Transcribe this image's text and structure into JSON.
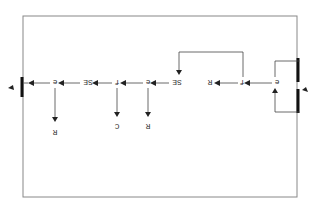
{
  "diagram": {
    "orientation": "rotated-180",
    "colors": {
      "frame": "#888888",
      "wire": "#444444",
      "bar": "#111111",
      "text": "#333333"
    },
    "nodes": {
      "n1": "e",
      "n2": "f",
      "n3": "R",
      "n4": "SE",
      "n5": "e",
      "n6": "f",
      "n7": "SE",
      "n8": "e",
      "b1": "R",
      "b2": "C",
      "b3": "R"
    }
  }
}
